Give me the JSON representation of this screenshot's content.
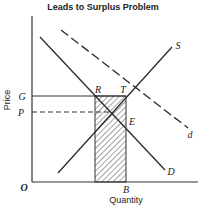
{
  "title": "Leads to Surplus Problem",
  "axes": {
    "x_label": "Quantity",
    "y_label": "Price",
    "origin": "O"
  },
  "price_labels": {
    "support_price": "G",
    "equilibrium_price": "P"
  },
  "quantity_labels": {
    "b": "B"
  },
  "curves": {
    "supply": "S",
    "demand": "D",
    "new_demand": "d"
  },
  "points": {
    "r": "R",
    "t": "T",
    "e": "E"
  },
  "colors": {
    "line": "#2a2a2a",
    "background": "#ffffff"
  }
}
